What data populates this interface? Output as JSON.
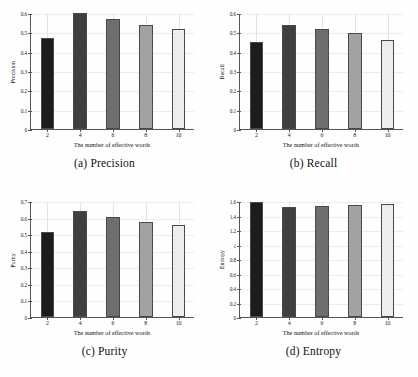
{
  "figure": {
    "shared_xlabel": "The number of effective words",
    "categories": [
      "2",
      "4",
      "6",
      "8",
      "10"
    ],
    "bar_colors": [
      "#1c1c1c",
      "#3f3f3f",
      "#6e6e6e",
      "#a2a2a2",
      "#ededed"
    ]
  },
  "panels": [
    {
      "id": "panel-precision",
      "caption_index": "(a)",
      "caption_text": "Precision",
      "ylabel": "Precision",
      "xlabel": "The number of effective words",
      "yticks": [
        "0",
        "0.1",
        "0.2",
        "0.3",
        "0.4",
        "0.5",
        "0.6"
      ],
      "xticks": [
        "2",
        "4",
        "6",
        "8",
        "10"
      ],
      "values": [
        0.47,
        0.598,
        0.567,
        0.54,
        0.515
      ],
      "ymin": 0,
      "ymax": 0.6
    },
    {
      "id": "panel-recall",
      "caption_index": "(b)",
      "caption_text": "Recall",
      "ylabel": "Recall",
      "xlabel": "The number of effective words",
      "yticks": [
        "0",
        "0.1",
        "0.2",
        "0.3",
        "0.4",
        "0.5",
        "0.6"
      ],
      "xticks": [
        "2",
        "4",
        "6",
        "8",
        "10"
      ],
      "values": [
        0.45,
        0.536,
        0.517,
        0.498,
        0.463
      ],
      "ymin": 0,
      "ymax": 0.6
    },
    {
      "id": "panel-purity",
      "caption_index": "(c)",
      "caption_text": "Purity",
      "ylabel": "Purity",
      "xlabel": "The number of effective words",
      "yticks": [
        "0",
        "0.1",
        "0.2",
        "0.3",
        "0.4",
        "0.5",
        "0.6",
        "0.7"
      ],
      "xticks": [
        "2",
        "4",
        "6",
        "8",
        "10"
      ],
      "values": [
        0.516,
        0.641,
        0.606,
        0.571,
        0.558
      ],
      "ymin": 0,
      "ymax": 0.7
    },
    {
      "id": "panel-entropy",
      "caption_index": "(d)",
      "caption_text": "Entropy",
      "ylabel": "Entropy",
      "xlabel": "The number of effective words",
      "yticks": [
        "0",
        "0.2",
        "0.4",
        "0.6",
        "0.8",
        "1",
        "1.2",
        "1.4",
        "1.6"
      ],
      "xticks": [
        "2",
        "4",
        "6",
        "8",
        "10"
      ],
      "values": [
        1.583,
        1.521,
        1.534,
        1.539,
        1.557
      ],
      "ymin": 0,
      "ymax": 1.6
    }
  ],
  "chart_data": [
    {
      "type": "bar",
      "title": "(a) Precision",
      "categories": [
        "2",
        "4",
        "6",
        "8",
        "10"
      ],
      "values": [
        0.47,
        0.598,
        0.567,
        0.54,
        0.515
      ],
      "xlabel": "The number of effective words",
      "ylabel": "Precision",
      "ylim": [
        0,
        0.6
      ],
      "yticks": [
        0,
        0.1,
        0.2,
        0.3,
        0.4,
        0.5,
        0.6
      ],
      "grid": "vertical-faint",
      "legend": "none"
    },
    {
      "type": "bar",
      "title": "(b) Recall",
      "categories": [
        "2",
        "4",
        "6",
        "8",
        "10"
      ],
      "values": [
        0.45,
        0.536,
        0.517,
        0.498,
        0.463
      ],
      "xlabel": "The number of effective words",
      "ylabel": "Recall",
      "ylim": [
        0,
        0.6
      ],
      "yticks": [
        0,
        0.1,
        0.2,
        0.3,
        0.4,
        0.5,
        0.6
      ],
      "grid": "vertical-faint",
      "legend": "none"
    },
    {
      "type": "bar",
      "title": "(c) Purity",
      "categories": [
        "2",
        "4",
        "6",
        "8",
        "10"
      ],
      "values": [
        0.516,
        0.641,
        0.606,
        0.571,
        0.558
      ],
      "xlabel": "The number of effective words",
      "ylabel": "Purity",
      "ylim": [
        0,
        0.7
      ],
      "yticks": [
        0,
        0.1,
        0.2,
        0.3,
        0.4,
        0.5,
        0.6,
        0.7
      ],
      "grid": "vertical-faint",
      "legend": "none"
    },
    {
      "type": "bar",
      "title": "(d) Entropy",
      "categories": [
        "2",
        "4",
        "6",
        "8",
        "10"
      ],
      "values": [
        1.583,
        1.521,
        1.534,
        1.539,
        1.557
      ],
      "xlabel": "The number of effective words",
      "ylabel": "Entropy",
      "ylim": [
        0,
        1.6
      ],
      "yticks": [
        0,
        0.2,
        0.4,
        0.6,
        0.8,
        1,
        1.2,
        1.4,
        1.6
      ],
      "grid": "vertical-faint",
      "legend": "none"
    }
  ]
}
